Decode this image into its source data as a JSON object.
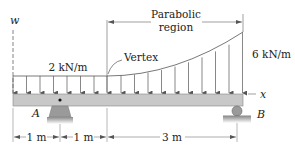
{
  "diagram": {
    "type": "beam-loading",
    "axis_labels": {
      "vertical": "w",
      "horizontal": "x"
    },
    "loads": {
      "uniform_label": "2 kN/m",
      "max_label": "6 kN/m",
      "vertex_label": "Vertex",
      "region_label_line1": "Parabolic",
      "region_label_line2": "region"
    },
    "supports": {
      "left": {
        "label": "A",
        "type": "pin"
      },
      "right": {
        "label": "B",
        "type": "roller"
      }
    },
    "dimensions": [
      {
        "label": "1 m"
      },
      {
        "label": "1 m"
      },
      {
        "label": "3 m"
      }
    ],
    "colors": {
      "beam": "#c8c8c8",
      "support": "#9a9a9a",
      "line": "#444444",
      "text": "#222222"
    }
  }
}
